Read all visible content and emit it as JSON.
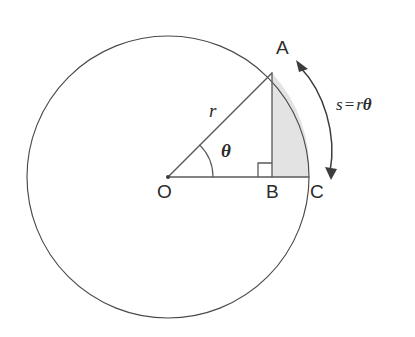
{
  "figure": {
    "type": "geometry-diagram",
    "background_color": "#ffffff",
    "stroke_color": "#4a4a4a",
    "shade_color": "#e3e3e3"
  },
  "labels": {
    "point_a": "A",
    "point_b": "B",
    "point_c": "C",
    "point_o": "O",
    "radius": "r",
    "angle": "θ",
    "arc_formula_s": "s",
    "arc_formula_eq": "=",
    "arc_formula_r": "r",
    "arc_formula_theta": "θ"
  },
  "geometry": {
    "circle": {
      "cx": 168,
      "cy": 177,
      "r": 141
    },
    "points": {
      "O": {
        "x": 168,
        "y": 177
      },
      "A": {
        "x": 272,
        "y": 73
      },
      "B": {
        "x": 272,
        "y": 177
      },
      "C": {
        "x": 309,
        "y": 177
      }
    },
    "angle_theta_degrees": 45,
    "angle_arc_radius": 45,
    "right_angle_marker": {
      "x": 258,
      "y": 163,
      "size": 14
    },
    "arrow": {
      "start": {
        "x": 298,
        "y": 64
      },
      "end": {
        "x": 331,
        "y": 176
      },
      "double_headed": true
    }
  }
}
